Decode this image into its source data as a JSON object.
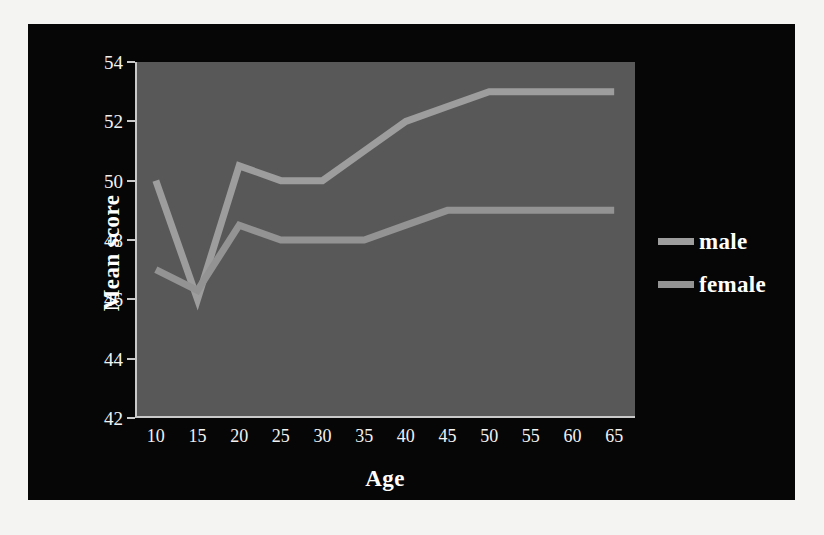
{
  "chart_data": {
    "type": "line",
    "title": "",
    "xlabel": "Age",
    "ylabel": "Mean score",
    "x": [
      10,
      15,
      20,
      25,
      30,
      35,
      40,
      45,
      50,
      55,
      60,
      65
    ],
    "xticklabels": [
      "10",
      "15",
      "20",
      "25",
      "30",
      "35",
      "40",
      "45",
      "50",
      "55",
      "60",
      "65"
    ],
    "yticklabels": [
      "42",
      "44",
      "46",
      "48",
      "50",
      "52",
      "54"
    ],
    "yticks": [
      42,
      44,
      46,
      48,
      50,
      52,
      54
    ],
    "xlim": [
      10,
      65
    ],
    "ylim": [
      42,
      54
    ],
    "grid": false,
    "legend_position": "right",
    "series": [
      {
        "name": "male",
        "color": "#9d9d9d",
        "values": [
          50.0,
          46.0,
          50.5,
          50.0,
          50.0,
          51.0,
          52.0,
          52.5,
          53.0,
          53.0,
          53.0,
          53.0
        ]
      },
      {
        "name": "female",
        "color": "#939393",
        "values": [
          47.0,
          46.3,
          48.5,
          48.0,
          48.0,
          48.0,
          48.5,
          49.0,
          49.0,
          49.0,
          49.0,
          49.0
        ]
      }
    ]
  },
  "style": {
    "page_background": "#f4f4f2",
    "panel_background": "#060606",
    "plot_background": "#585858",
    "axis_color": "#c9c9c9",
    "text_color": "#ffffff"
  }
}
